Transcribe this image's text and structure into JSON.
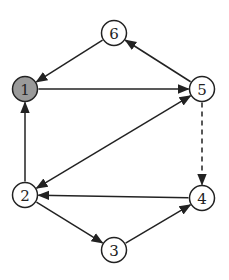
{
  "diagram": {
    "type": "directed-graph",
    "nodes": [
      {
        "id": "1",
        "label": "1",
        "x": 25,
        "y": 89,
        "fill": "#9a9a9a",
        "highlighted": true
      },
      {
        "id": "2",
        "label": "2",
        "x": 25,
        "y": 195,
        "fill": "#ffffff",
        "highlighted": false
      },
      {
        "id": "3",
        "label": "3",
        "x": 114,
        "y": 250,
        "fill": "#ffffff",
        "highlighted": false
      },
      {
        "id": "4",
        "label": "4",
        "x": 202,
        "y": 198,
        "fill": "#ffffff",
        "highlighted": false
      },
      {
        "id": "5",
        "label": "5",
        "x": 202,
        "y": 89,
        "fill": "#ffffff",
        "highlighted": false
      },
      {
        "id": "6",
        "label": "6",
        "x": 114,
        "y": 33,
        "fill": "#ffffff",
        "highlighted": false
      }
    ],
    "edges": [
      {
        "from": "6",
        "to": "1",
        "style": "solid",
        "bidirectional": false
      },
      {
        "from": "5",
        "to": "6",
        "style": "solid",
        "bidirectional": false
      },
      {
        "from": "1",
        "to": "5",
        "style": "solid",
        "bidirectional": false
      },
      {
        "from": "2",
        "to": "1",
        "style": "solid",
        "bidirectional": false
      },
      {
        "from": "2",
        "to": "5",
        "style": "solid",
        "bidirectional": true
      },
      {
        "from": "5",
        "to": "4",
        "style": "dashed",
        "bidirectional": false
      },
      {
        "from": "4",
        "to": "2",
        "style": "solid",
        "bidirectional": false
      },
      {
        "from": "2",
        "to": "3",
        "style": "solid",
        "bidirectional": false
      },
      {
        "from": "3",
        "to": "4",
        "style": "solid",
        "bidirectional": false
      }
    ]
  }
}
